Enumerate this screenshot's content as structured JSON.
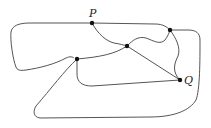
{
  "diagram": {
    "type": "graph",
    "labels": {
      "P": "P",
      "Q": "Q"
    },
    "vertices": [
      {
        "id": "P",
        "label": "P",
        "x": 92,
        "y": 23
      },
      {
        "id": "A",
        "label": "",
        "x": 170,
        "y": 30
      },
      {
        "id": "C",
        "label": "",
        "x": 127,
        "y": 46
      },
      {
        "id": "L",
        "label": "",
        "x": 77,
        "y": 59
      },
      {
        "id": "Q",
        "label": "Q",
        "x": 180,
        "y": 80
      }
    ],
    "edges": [
      {
        "from": "P",
        "to": "A"
      },
      {
        "from": "P",
        "to": "C"
      },
      {
        "from": "C",
        "to": "A"
      },
      {
        "from": "C",
        "to": "Q"
      },
      {
        "from": "A",
        "to": "Q"
      },
      {
        "from": "C",
        "to": "L"
      },
      {
        "from": "L",
        "to": "Q"
      },
      {
        "from": "P",
        "to": "L"
      },
      {
        "from": "L",
        "to": "A"
      }
    ],
    "colors": {
      "edge": "#555555",
      "vertex": "#111111",
      "background": "#ffffff"
    }
  }
}
